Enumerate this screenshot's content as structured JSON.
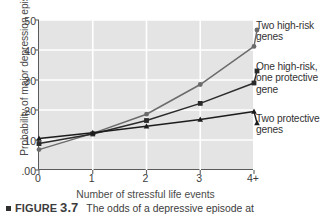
{
  "chart_data": {
    "type": "line",
    "title": "",
    "xlabel": "Number of stressful life events",
    "ylabel": "Probability of major depression episode",
    "categories": [
      "0",
      "1",
      "2",
      "3",
      "4+"
    ],
    "x": [
      0,
      1,
      2,
      3,
      4
    ],
    "xlim": [
      0,
      4
    ],
    "ylim": [
      0.0,
      0.5
    ],
    "yticks": [
      ".00",
      ".10",
      ".20",
      ".30",
      ".40",
      ".50"
    ],
    "ytick_values": [
      0.0,
      0.1,
      0.2,
      0.3,
      0.4,
      0.5
    ],
    "grid": true,
    "legend_position": "right",
    "series": [
      {
        "name": "Two high-risk genes",
        "marker": "circle",
        "color": "#6b6b6b",
        "values": [
          0.068,
          0.122,
          0.186,
          0.285,
          0.412
        ]
      },
      {
        "name": "One high-risk, one protective gene",
        "marker": "square",
        "color": "#2b2b2b",
        "values": [
          0.088,
          0.12,
          0.165,
          0.222,
          0.29
        ]
      },
      {
        "name": "Two protective genes",
        "marker": "triangle",
        "color": "#1c1c1c",
        "values": [
          0.105,
          0.124,
          0.146,
          0.168,
          0.195
        ]
      }
    ]
  },
  "legend": {
    "entries": [
      {
        "line1": "Two high-risk",
        "line2": "genes",
        "line3": ""
      },
      {
        "line1": "One high-risk,",
        "line2": "one protective",
        "line3": "gene"
      },
      {
        "line1": "Two protective",
        "line2": "genes",
        "line3": ""
      }
    ]
  },
  "caption": {
    "label": "FIGURE",
    "number": "3.7",
    "text": "The odds of a depressive episode at"
  },
  "colors": {
    "plot_background": "#e4e4e4",
    "gridline": "#ffffff",
    "axis": "#5a5a5a",
    "text": "#3c3c3c"
  }
}
